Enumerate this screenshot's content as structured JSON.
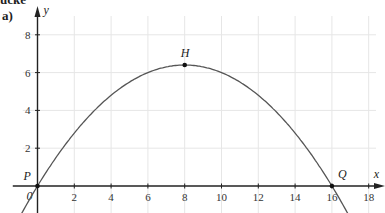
{
  "header": {
    "title_fragment": "ücke",
    "part_label": "a)"
  },
  "chart_data": {
    "type": "line",
    "title": "",
    "xlabel": "x",
    "ylabel": "y",
    "xlim": [
      -0.8,
      19
    ],
    "ylim": [
      -1.4,
      9.2
    ],
    "grid": true,
    "x_ticks": [
      2,
      4,
      6,
      8,
      10,
      12,
      14,
      16,
      18
    ],
    "y_ticks": [
      2,
      4,
      6,
      8
    ],
    "origin_label": "0",
    "series": [
      {
        "name": "parabola",
        "function": "y = -0.1x^2 + 1.6x",
        "x": [
          -1,
          0,
          2,
          4,
          6,
          8,
          10,
          12,
          14,
          16,
          17
        ],
        "values": [
          -1.7,
          0,
          2.8,
          4.8,
          6.0,
          6.4,
          6.0,
          4.8,
          2.8,
          0,
          -1.7
        ],
        "color": "#555555"
      }
    ],
    "points": [
      {
        "label": "P",
        "x": 0,
        "y": 0
      },
      {
        "label": "H",
        "x": 8,
        "y": 6.4
      },
      {
        "label": "Q",
        "x": 16,
        "y": 0
      }
    ]
  }
}
